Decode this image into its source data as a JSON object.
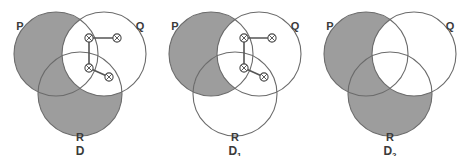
{
  "figure": {
    "type": "venn-diagram-series",
    "panel_count": 3,
    "colors": {
      "shaded_region": "#9d9d9d",
      "unshaded_region": "#ffffff",
      "circle_outline": "#6b6b6b",
      "graph_edge": "#555555",
      "node_stroke": "#4a4a4a",
      "label_text": "#3a3a3a",
      "background": "#ffffff"
    },
    "geometry": {
      "circle_radius": 42,
      "p_center": {
        "cx": 56,
        "cy": 54
      },
      "q_center": {
        "cx": 104,
        "cy": 54
      },
      "r_center": {
        "cx": 80,
        "cy": 94
      }
    },
    "panels": [
      {
        "id": "panel-d",
        "caption": "D",
        "caption_subscript": "",
        "set_labels": {
          "p": "P",
          "q": "Q",
          "r": "R"
        },
        "shaded_sets": [
          "P",
          "R"
        ],
        "unshaded_regions": [
          "P∩Q",
          "Q",
          "P∩Q∩R",
          "Q∩R"
        ],
        "has_graph": true,
        "nodes": [
          {
            "id": "n1",
            "cx": 89,
            "cy": 38,
            "marker": "crossed-circle"
          },
          {
            "id": "n2",
            "cx": 117,
            "cy": 38,
            "marker": "crossed-circle"
          },
          {
            "id": "n3",
            "cx": 89,
            "cy": 68,
            "marker": "crossed-circle"
          },
          {
            "id": "n4",
            "cx": 109,
            "cy": 77,
            "marker": "crossed-circle"
          }
        ],
        "edges": [
          {
            "from": "n1",
            "to": "n2"
          },
          {
            "from": "n1",
            "to": "n3"
          },
          {
            "from": "n3",
            "to": "n4"
          }
        ]
      },
      {
        "id": "panel-d1",
        "caption": "D",
        "caption_subscript": "1",
        "set_labels": {
          "p": "P",
          "q": "Q",
          "r": "R"
        },
        "shaded_sets": [
          "P"
        ],
        "unshaded_regions": [
          "Q",
          "R",
          "P∩Q",
          "Q∩R",
          "P∩Q∩R"
        ],
        "has_graph": true,
        "nodes": [
          {
            "id": "n1",
            "cx": 89,
            "cy": 38,
            "marker": "crossed-circle"
          },
          {
            "id": "n2",
            "cx": 117,
            "cy": 38,
            "marker": "crossed-circle"
          },
          {
            "id": "n3",
            "cx": 89,
            "cy": 68,
            "marker": "crossed-circle"
          },
          {
            "id": "n4",
            "cx": 109,
            "cy": 77,
            "marker": "crossed-circle"
          }
        ],
        "edges": [
          {
            "from": "n1",
            "to": "n2"
          },
          {
            "from": "n1",
            "to": "n3"
          },
          {
            "from": "n3",
            "to": "n4"
          }
        ]
      },
      {
        "id": "panel-d2",
        "caption": "D",
        "caption_subscript": "2",
        "set_labels": {
          "p": "P",
          "q": "Q",
          "r": "R"
        },
        "shaded_sets": [
          "P",
          "R"
        ],
        "unshaded_regions": [
          "P∩Q",
          "Q",
          "P∩Q∩R",
          "Q∩R"
        ],
        "has_graph": false,
        "nodes": [],
        "edges": []
      }
    ]
  }
}
